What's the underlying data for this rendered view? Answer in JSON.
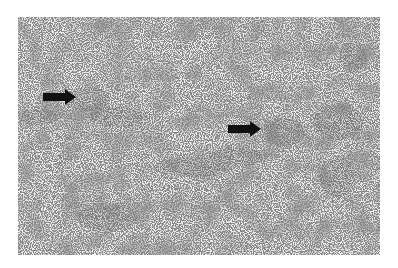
{
  "figure": {
    "type": "micrograph",
    "background_color": "#ffffff",
    "tissue_base_color": "#ececec",
    "stain_color": "#6a6a6a",
    "arrows": [
      {
        "name": "arrow-left",
        "x": 43,
        "y": 91,
        "direction": "right",
        "color": "#111111"
      },
      {
        "name": "arrow-right",
        "x": 228,
        "y": 122,
        "direction": "right",
        "color": "#111111"
      }
    ]
  }
}
